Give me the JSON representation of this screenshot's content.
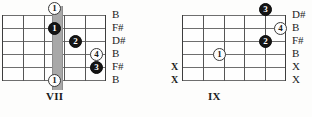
{
  "page": {
    "background_color": "#fdfdfc"
  },
  "diagrams": [
    {
      "id": "chord-left",
      "position_label": "VII",
      "strings": 6,
      "frets": 4,
      "barre": {
        "fret": 3,
        "from_string": 1,
        "to_string": 6,
        "color": "#a8a8a8"
      },
      "markers": [
        {
          "finger": "1",
          "style": "open",
          "string": 1,
          "fret": 0,
          "above_nut": true
        },
        {
          "finger": "1",
          "style": "filled",
          "string": 2,
          "fret": 3
        },
        {
          "finger": "2",
          "style": "filled",
          "string": 3,
          "fret": 4
        },
        {
          "finger": "4",
          "style": "open",
          "string": 4,
          "fret": 5
        },
        {
          "finger": "3",
          "style": "filled",
          "string": 5,
          "fret": 5
        },
        {
          "finger": "1",
          "style": "open",
          "string": 6,
          "fret": 0,
          "below_grid": true
        }
      ],
      "note_labels": [
        "B",
        "F#",
        "D#",
        "B",
        "F#",
        "B"
      ],
      "muted_strings": []
    },
    {
      "id": "chord-right",
      "position_label": "IX",
      "strings": 6,
      "frets": 5,
      "barre": null,
      "markers": [
        {
          "finger": "3",
          "style": "filled",
          "string": 1,
          "fret": 4
        },
        {
          "finger": "4",
          "style": "open",
          "string": 2,
          "fret": 5
        },
        {
          "finger": "2",
          "style": "filled",
          "string": 3,
          "fret": 4
        },
        {
          "finger": "1",
          "style": "open",
          "string": 4,
          "fret": 2
        }
      ],
      "note_labels": [
        "D#",
        "B",
        "F#",
        "B",
        "X",
        "X"
      ],
      "muted_strings": [
        "X",
        "X"
      ]
    }
  ]
}
